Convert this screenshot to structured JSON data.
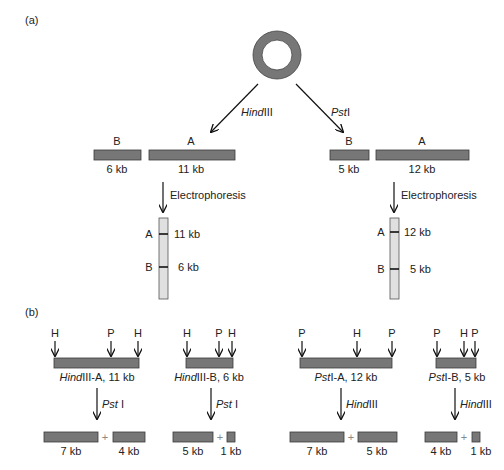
{
  "panel_a": {
    "label": "(a)",
    "plasmid": {
      "shape": "circular-dna",
      "color": "#777777"
    },
    "enzymes": {
      "left": "HindIII",
      "left_italic": "Hind",
      "left_roman": "III",
      "right": "PstI",
      "right_italic": "Pst",
      "right_roman": "I"
    },
    "hindiii_digest": {
      "fragments": [
        {
          "name": "B",
          "size": "6 kb"
        },
        {
          "name": "A",
          "size": "11 kb"
        }
      ],
      "step_label": "Electrophoresis",
      "gel_bands": [
        {
          "name": "A",
          "size": "11 kb"
        },
        {
          "name": "B",
          "size": "6 kb"
        }
      ]
    },
    "psti_digest": {
      "fragments": [
        {
          "name": "B",
          "size": "5 kb"
        },
        {
          "name": "A",
          "size": "12 kb"
        }
      ],
      "step_label": "Electrophoresis",
      "gel_bands": [
        {
          "name": "A",
          "size": "12 kb"
        },
        {
          "name": "B",
          "size": "5 kb"
        }
      ]
    }
  },
  "panel_b": {
    "label": "(b)",
    "groups": [
      {
        "fragment_italic": "Hind",
        "fragment_rest": "III-A, 11 kb",
        "sites": [
          "H",
          "P",
          "H"
        ],
        "enzyme_italic": "Pst",
        "enzyme_rest": " I",
        "products": [
          "7 kb",
          "4 kb"
        ]
      },
      {
        "fragment_italic": "Hind",
        "fragment_rest": "III-B, 6 kb",
        "sites": [
          "H",
          "P",
          "H"
        ],
        "enzyme_italic": "Pst",
        "enzyme_rest": " I",
        "products": [
          "5 kb",
          "1 kb"
        ]
      },
      {
        "fragment_italic": "Pst",
        "fragment_rest": "I-A, 12 kb",
        "sites": [
          "P",
          "H",
          "P"
        ],
        "enzyme_italic": "Hind",
        "enzyme_rest": "III",
        "products": [
          "7 kb",
          "5 kb"
        ]
      },
      {
        "fragment_italic": "Pst",
        "fragment_rest": "I-B, 5 kb",
        "sites": [
          "P",
          "H",
          "P"
        ],
        "enzyme_italic": "Hind",
        "enzyme_rest": "III",
        "products": [
          "4 kb",
          "1 kb"
        ]
      }
    ],
    "plus": "+"
  },
  "colors": {
    "fragment_fill": "#777777",
    "gel_fill": "#e0e0e0",
    "ink": "#111111"
  }
}
